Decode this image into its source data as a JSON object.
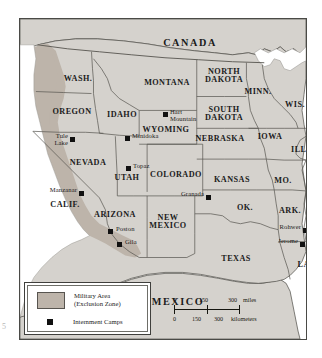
{
  "map": {
    "title": "Japanese American Internment Camps and West Coast Military Exclusion Zone",
    "countries": [
      {
        "name": "CANADA",
        "x": 170,
        "y": 24
      },
      {
        "name": "MEXICO",
        "x": 158,
        "y": 283
      }
    ],
    "states": [
      {
        "name": "WASH.",
        "x": 58,
        "y": 60,
        "size": "state"
      },
      {
        "name": "OREGON",
        "x": 52,
        "y": 93,
        "size": "state"
      },
      {
        "name": "IDAHO",
        "x": 102,
        "y": 96,
        "size": "state"
      },
      {
        "name": "MONTANA",
        "x": 147,
        "y": 64,
        "size": "state"
      },
      {
        "name": "NORTH\nDAKOTA",
        "x": 204,
        "y": 57,
        "size": "state"
      },
      {
        "name": "SOUTH\nDAKOTA",
        "x": 204,
        "y": 95,
        "size": "state"
      },
      {
        "name": "MINN.",
        "x": 238,
        "y": 73,
        "size": "state"
      },
      {
        "name": "WIS.",
        "x": 275,
        "y": 86,
        "size": "state"
      },
      {
        "name": "WYOMING",
        "x": 146,
        "y": 111,
        "size": "state"
      },
      {
        "name": "NEBRASKA",
        "x": 200,
        "y": 120,
        "size": "state"
      },
      {
        "name": "IOWA",
        "x": 250,
        "y": 118,
        "size": "state"
      },
      {
        "name": "ILL.",
        "x": 280,
        "y": 131,
        "size": "state"
      },
      {
        "name": "NEVADA",
        "x": 68,
        "y": 144,
        "size": "state"
      },
      {
        "name": "UTAH",
        "x": 107,
        "y": 159,
        "size": "state"
      },
      {
        "name": "COLORADO",
        "x": 156,
        "y": 156,
        "size": "state"
      },
      {
        "name": "KANSAS",
        "x": 212,
        "y": 161,
        "size": "state"
      },
      {
        "name": "MO.",
        "x": 263,
        "y": 162,
        "size": "state"
      },
      {
        "name": "CALIF.",
        "x": 45,
        "y": 186,
        "size": "state"
      },
      {
        "name": "ARIZONA",
        "x": 95,
        "y": 196,
        "size": "state"
      },
      {
        "name": "NEW\nMEXICO",
        "x": 148,
        "y": 203,
        "size": "state"
      },
      {
        "name": "OK.",
        "x": 225,
        "y": 189,
        "size": "state"
      },
      {
        "name": "ARK.",
        "x": 270,
        "y": 192,
        "size": "state"
      },
      {
        "name": "TEXAS",
        "x": 216,
        "y": 240,
        "size": "state"
      },
      {
        "name": "LA.",
        "x": 285,
        "y": 246,
        "size": "state"
      }
    ],
    "camps": [
      {
        "name": "Tule\nLake",
        "sq_x": 50,
        "sq_y": 118,
        "tx": 28,
        "ty": 114,
        "align": "right"
      },
      {
        "name": "Minidoka",
        "sq_x": 105,
        "sq_y": 117,
        "tx": 112,
        "ty": 114,
        "align": "left"
      },
      {
        "name": "Hart\nMountain",
        "sq_x": 143,
        "sq_y": 93,
        "tx": 150,
        "ty": 90,
        "align": "left"
      },
      {
        "name": "Topaz",
        "sq_x": 106,
        "sq_y": 147,
        "tx": 113,
        "ty": 144,
        "align": "left"
      },
      {
        "name": "Manzanar",
        "sq_x": 59,
        "sq_y": 172,
        "tx": 16,
        "ty": 168,
        "align": "right"
      },
      {
        "name": "Granada",
        "sq_x": 186,
        "sq_y": 176,
        "tx": 147,
        "ty": 172,
        "align": "right"
      },
      {
        "name": "Poston",
        "sq_x": 88,
        "sq_y": 210,
        "tx": 96,
        "ty": 207,
        "align": "left"
      },
      {
        "name": "Gila",
        "sq_x": 97,
        "sq_y": 223,
        "tx": 105,
        "ty": 220,
        "align": "left"
      },
      {
        "name": "Rohwer",
        "sq_x": 283,
        "sq_y": 209,
        "tx": 245,
        "ty": 205,
        "align": "right"
      },
      {
        "name": "Jerome",
        "sq_x": 280,
        "sq_y": 223,
        "tx": 242,
        "ty": 219,
        "align": "right"
      }
    ],
    "legend": {
      "area_label": "Military Area\n(Exclusion Zone)",
      "camp_label": "Internment Camps",
      "area_color": "#bdb4aa",
      "camp_color": "#111111"
    },
    "scale": {
      "miles": {
        "ticks": [
          "0",
          "150",
          "300"
        ],
        "unit": "miles"
      },
      "kilometers": {
        "ticks": [
          "0",
          "150",
          "300"
        ],
        "unit": "kilometers"
      }
    },
    "colors": {
      "land": "#d5d2cd",
      "exclusion_zone": "#bdb4aa",
      "border": "#4a4a46",
      "water": "#ffffff"
    },
    "edge_mark": "5"
  }
}
